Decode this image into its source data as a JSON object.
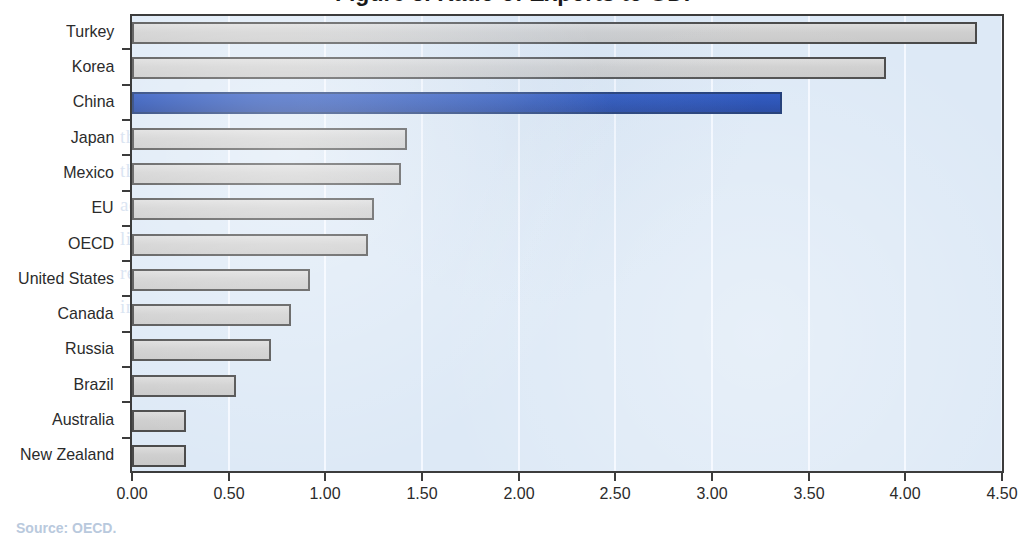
{
  "chart_data": {
    "type": "bar",
    "orientation": "horizontal",
    "title": "",
    "xlabel": "",
    "ylabel": "",
    "xlim": [
      0.0,
      4.5
    ],
    "xticks": [
      "0.00",
      "0.50",
      "1.00",
      "1.50",
      "2.00",
      "2.50",
      "3.00",
      "3.50",
      "4.00",
      "4.50"
    ],
    "xtick_values": [
      0.0,
      0.5,
      1.0,
      1.5,
      2.0,
      2.5,
      3.0,
      3.5,
      4.0,
      4.5
    ],
    "grid": "vertical",
    "legend": "none",
    "categories": [
      "Turkey",
      "Korea",
      "China",
      "Japan",
      "Mexico",
      "EU",
      "OECD",
      "United States",
      "Canada",
      "Russia",
      "Brazil",
      "Australia",
      "New Zealand"
    ],
    "values": [
      4.37,
      3.9,
      3.36,
      1.42,
      1.39,
      1.25,
      1.22,
      0.92,
      0.82,
      0.72,
      0.54,
      0.28,
      0.28
    ],
    "highlight_category": "China",
    "colors": {
      "bar_fill": "#d2d2d2",
      "bar_border": "#4a4a4a",
      "highlight_fill": "#1b46b0",
      "highlight_border": "#13306f",
      "plot_background": "#dde9f6",
      "gridline": "#f4f9ff",
      "axis": "#3c3c3c",
      "text": "#2b2b2b"
    }
  },
  "page": {
    "title_sliver": "Figure 3. Ratio of Exports to GDP",
    "source_note": "Source: OECD.",
    "ghost_text": "the reverse side of the printed page shows faintly through\nthe paper and the scanned image retains a soft blue cast\nacross the plotting area of the figure below the heading\nline where the original typeset paragraph discussed the\nrelative openness of the economies that are compared\nin the chart together with a note on the sources used"
  }
}
